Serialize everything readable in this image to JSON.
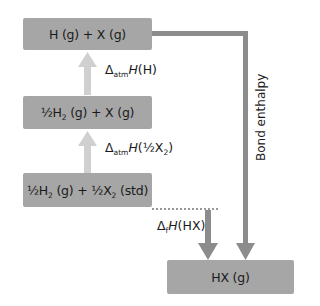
{
  "diagram": {
    "type": "Born-Haber style enthalpy cycle",
    "levels": [
      {
        "id": "top",
        "parts": [
          "H (g) + X (g)"
        ]
      },
      {
        "id": "middle",
        "parts": [
          "½H",
          "2",
          " (g) + X (g)"
        ]
      },
      {
        "id": "bottom",
        "parts": [
          "½H",
          "2",
          " (g) + ½X",
          "2",
          " (std)"
        ]
      },
      {
        "id": "product",
        "parts": [
          "HX (g)"
        ]
      }
    ],
    "arrows": {
      "atomisation_h": {
        "delta": "Δ",
        "sub": "atm",
        "H": "H",
        "arg": "(H)"
      },
      "atomisation_x": {
        "delta": "Δ",
        "sub": "atm",
        "H": "H",
        "arg_prefix": "(½X",
        "arg_sub": "2",
        "arg_suffix": ")"
      },
      "formation": {
        "delta": "Δ",
        "sub": "f",
        "H": "H",
        "arg": "(HX)"
      },
      "bond_enthalpy": {
        "label": "Bond enthalpy"
      }
    },
    "colors": {
      "box_fill": "#a6a6a6",
      "up_arrow": "#d0d0d0",
      "down_arrow": "#8c8c8c",
      "text": "#1a1a1a"
    }
  }
}
